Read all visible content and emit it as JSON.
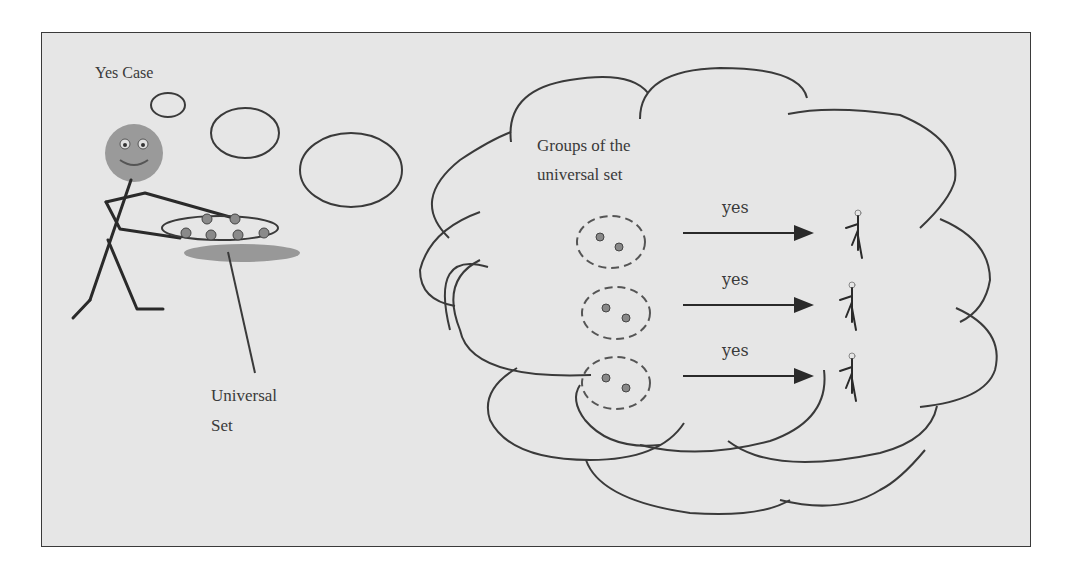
{
  "diagram": {
    "title": "Yes Case",
    "universal_set_label_line1": "Universal",
    "universal_set_label_line2": "Set",
    "cloud_label_line1": "Groups of the",
    "cloud_label_line2": "universal set",
    "arrows": [
      {
        "label": "yes"
      },
      {
        "label": "yes"
      },
      {
        "label": "yes"
      }
    ],
    "colors": {
      "background": "#e6e6e6",
      "stroke": "#3a3a3a",
      "face": "#9a9a9a",
      "shadow": "#8a8a8a"
    }
  }
}
